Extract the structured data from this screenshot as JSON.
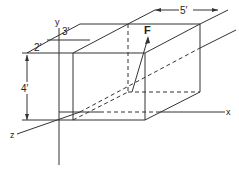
{
  "diagram": {
    "type": "3d-box-force-diagram",
    "axes": {
      "x_label": "x",
      "y_label": "y",
      "z_label": "z"
    },
    "force_label": "F",
    "dimensions": {
      "length": "5′",
      "depth_offset": "3′",
      "front_offset": "2′",
      "height": "4′"
    },
    "colors": {
      "line": "#333333",
      "background": "#ffffff"
    }
  }
}
